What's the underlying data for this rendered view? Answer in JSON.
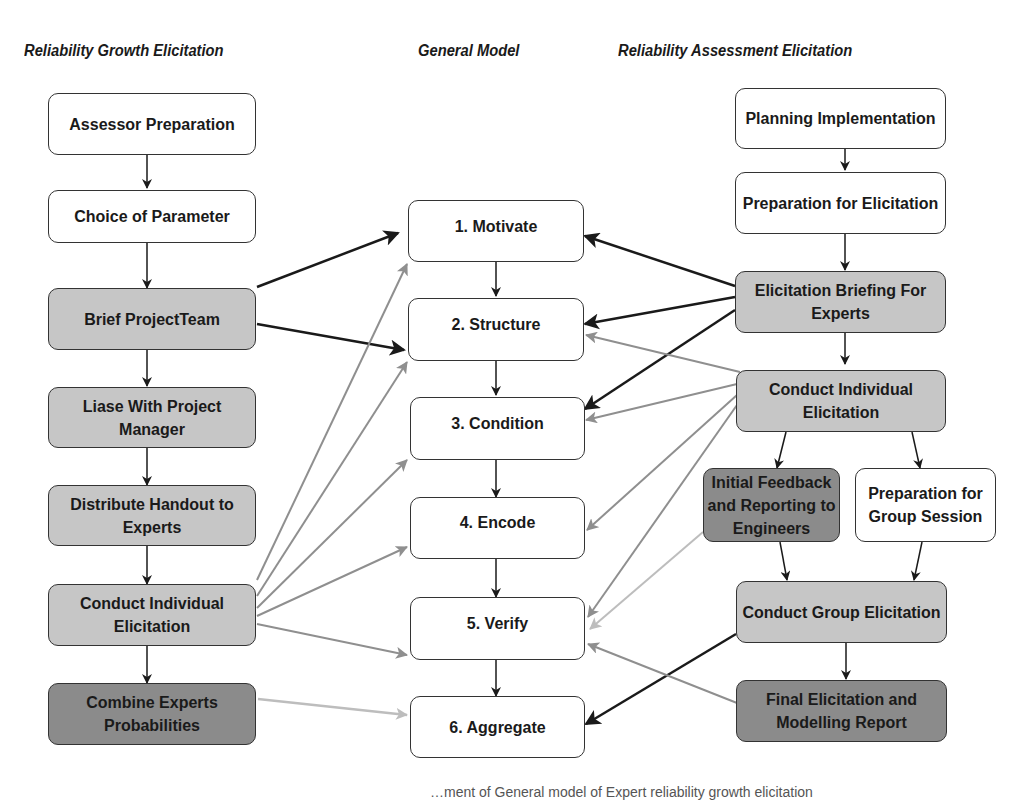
{
  "headings": {
    "left": "Reliability Growth Elicitation",
    "middle": "General Model",
    "right": "Reliability Assessment Elicitation"
  },
  "left_column": [
    {
      "id": "assessor-preparation",
      "label": "Assessor Preparation",
      "shade": "white"
    },
    {
      "id": "choice-of-parameter",
      "label": "Choice of Parameter",
      "shade": "white"
    },
    {
      "id": "brief-project-team",
      "label": "Brief ProjectTeam",
      "shade": "light"
    },
    {
      "id": "liase-with-project-manager",
      "label": "Liase With Project Manager",
      "shade": "light"
    },
    {
      "id": "distribute-handout",
      "label": "Distribute Handout to Experts",
      "shade": "light"
    },
    {
      "id": "conduct-individual-elicitation-left",
      "label": "Conduct Individual Elicitation",
      "shade": "light"
    },
    {
      "id": "combine-experts-probabilities",
      "label": "Combine Experts Probabilities",
      "shade": "dark"
    }
  ],
  "middle_column": [
    {
      "id": "motivate",
      "label": "1. Motivate"
    },
    {
      "id": "structure",
      "label": "2. Structure"
    },
    {
      "id": "condition",
      "label": "3. Condition"
    },
    {
      "id": "encode",
      "label": "4. Encode"
    },
    {
      "id": "verify",
      "label": "5. Verify"
    },
    {
      "id": "aggregate",
      "label": "6. Aggregate"
    }
  ],
  "right_column": [
    {
      "id": "planning-implementation",
      "label": "Planning Implementation",
      "shade": "white"
    },
    {
      "id": "preparation-for-elicitation",
      "label": "Preparation for Elicitation",
      "shade": "white"
    },
    {
      "id": "elicitation-briefing",
      "label": "Elicitation Briefing For Experts",
      "shade": "light"
    },
    {
      "id": "conduct-individual-elicitation-right",
      "label": "Conduct Individual Elicitation",
      "shade": "light"
    },
    {
      "id": "initial-feedback",
      "label": "Initial Feedback and Reporting to Engineers",
      "shade": "dark"
    },
    {
      "id": "preparation-group-session",
      "label": "Preparation for Group Session",
      "shade": "white"
    },
    {
      "id": "conduct-group-elicitation",
      "label": "Conduct Group Elicitation",
      "shade": "light"
    },
    {
      "id": "final-report",
      "label": "Final Elicitation and Modelling Report",
      "shade": "dark"
    }
  ],
  "edges": [
    {
      "from": "Brief ProjectTeam",
      "to": "1. Motivate",
      "style": "black"
    },
    {
      "from": "Brief ProjectTeam",
      "to": "2. Structure",
      "style": "black"
    },
    {
      "from": "Conduct Individual Elicitation (left)",
      "to": [
        "1. Motivate",
        "2. Structure",
        "3. Condition",
        "4. Encode",
        "5. Verify"
      ],
      "style": "gray"
    },
    {
      "from": "Combine Experts Probabilities",
      "to": "6. Aggregate",
      "style": "lightgray"
    },
    {
      "from": "Elicitation Briefing For Experts",
      "to": [
        "1. Motivate",
        "2. Structure",
        "3. Condition"
      ],
      "style": "black"
    },
    {
      "from": "Conduct Individual Elicitation (right)",
      "to": [
        "2. Structure",
        "3. Condition",
        "4. Encode",
        "5. Verify"
      ],
      "style": "gray"
    },
    {
      "from": "Initial Feedback and Reporting to Engineers",
      "to": "5. Verify",
      "style": "lightgray"
    },
    {
      "from": "Conduct Group Elicitation",
      "to": "6. Aggregate",
      "style": "black"
    },
    {
      "from": "Final Elicitation and Modelling Report",
      "to": "5. Verify",
      "style": "gray"
    }
  ],
  "colors": {
    "box_white": "#ffffff",
    "box_light": "#c6c6c6",
    "box_dark": "#8b8b8b",
    "arrow_black": "#1a1a1a",
    "arrow_gray": "#8f8f8f",
    "arrow_lightgray": "#bdbdbd"
  },
  "caption_fragment": "…ment of General model of Expert reliability growth elicitation"
}
